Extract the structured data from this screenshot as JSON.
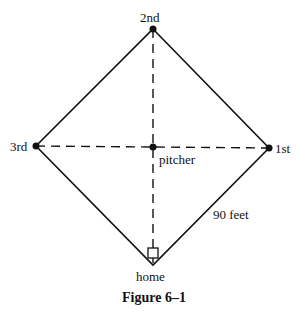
{
  "diagram": {
    "bases": {
      "second": "2nd",
      "third": "3rd",
      "first": "1st",
      "home": "home"
    },
    "pitcher_label": "pitcher",
    "side_length_label": "90 feet",
    "caption": "Figure 6–1"
  }
}
